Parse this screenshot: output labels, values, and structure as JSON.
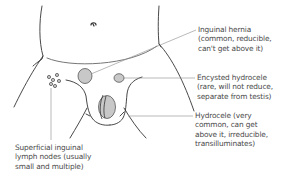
{
  "diagram": {
    "colors": {
      "outline": "#333333",
      "leader": "#8a8a8a",
      "fill": "#c8c8c8",
      "text": "#4a4a4a"
    },
    "labels": [
      {
        "id": "inguinal-hernia",
        "lines": [
          "Inguinal hernia",
          "(common, reducible,",
          "can't get above it)"
        ]
      },
      {
        "id": "encysted-hydrocele",
        "lines": [
          "Encysted hydrocele",
          "(rare, will not reduce,",
          "separate from testis)"
        ]
      },
      {
        "id": "hydrocele",
        "lines": [
          "Hydrocele (very",
          "common, can get",
          "above it, irreducible,",
          "transilluminates)"
        ]
      },
      {
        "id": "superficial-inguinal-lymph-nodes",
        "lines": [
          "Superficial inguinal",
          "lymph nodes (usually",
          "small and multiple)"
        ]
      }
    ]
  }
}
